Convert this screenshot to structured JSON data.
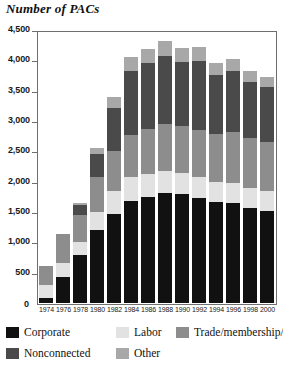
{
  "chart_data": {
    "type": "bar",
    "subtype": "stacked-vertical",
    "title": "Number of PACs",
    "xlabel": "",
    "ylabel": "",
    "ylim": [
      0,
      4500
    ],
    "ytick_step": 500,
    "ytick_labels": [
      "0",
      "500",
      "1,000",
      "1,500",
      "2,000",
      "2,500",
      "3,000",
      "3,500",
      "4,000",
      "4,500"
    ],
    "ytick_values": [
      0,
      500,
      1000,
      1500,
      2000,
      2500,
      3000,
      3500,
      4000,
      4500
    ],
    "grid": false,
    "legend_position": "below",
    "categories": [
      "1974",
      "1976",
      "1978",
      "1980",
      "1982",
      "1984",
      "1986",
      "1988",
      "1990",
      "1992",
      "1994",
      "1996",
      "1998",
      "2000"
    ],
    "series": [
      {
        "name": "Corporate",
        "color": "#111111",
        "values": [
          89,
          433,
          785,
          1206,
          1469,
          1682,
          1744,
          1816,
          1795,
          1735,
          1660,
          1642,
          1567,
          1523
        ]
      },
      {
        "name": "Labor",
        "color": "#e2e2e2",
        "values": [
          201,
          224,
          217,
          297,
          380,
          394,
          384,
          354,
          346,
          347,
          333,
          332,
          321,
          316
        ]
      },
      {
        "name": "Trade/membership/health",
        "color": "#8d8d8d",
        "values": [
          318,
          489,
          453,
          576,
          649,
          698,
          745,
          786,
          774,
          770,
          792,
          838,
          825,
          812
        ]
      },
      {
        "name": "Nonconnected",
        "color": "#4a4a4a",
        "values": [
          0,
          0,
          162,
          374,
          723,
          1053,
          1077,
          1115,
          1062,
          1145,
          980,
          1020,
          935,
          902
        ]
      },
      {
        "name": "Other",
        "color": "#a8a8a8",
        "values": [
          0,
          0,
          36,
          104,
          172,
          223,
          237,
          241,
          232,
          221,
          193,
          193,
          182,
          177
        ]
      }
    ]
  },
  "legend": {
    "items": [
      {
        "label": "Corporate",
        "color": "#111111"
      },
      {
        "label": "Labor",
        "color": "#e2e2e2"
      },
      {
        "label": "Trade/membership/health",
        "color": "#8d8d8d"
      },
      {
        "label": "Nonconnected",
        "color": "#4a4a4a"
      },
      {
        "label": "Other",
        "color": "#a8a8a8"
      }
    ]
  },
  "axis": {
    "zero_label": "0"
  }
}
